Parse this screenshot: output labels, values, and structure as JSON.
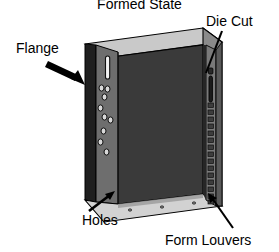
{
  "figure": {
    "title": "Formed State",
    "type": "technical-illustration"
  },
  "callouts": [
    {
      "id": "flange",
      "label": "Flange",
      "pointer": "arrow",
      "target": "left vertical flange strip"
    },
    {
      "id": "diecut",
      "label": "Die Cut",
      "pointer": "leader-line",
      "target": "vertical die cut slot on right return"
    },
    {
      "id": "holes",
      "label": "Holes",
      "pointer": "arrow",
      "target": "bottom flange hole row"
    },
    {
      "id": "louvers",
      "label": "Form Louvers",
      "pointer": "leader-line",
      "target": "louver slot column on right return"
    }
  ],
  "geometry": {
    "flange_slot_count": 1,
    "flange_hole_count": 9,
    "louver_count": 16,
    "bottom_hole_count": 3
  },
  "colors": {
    "background": "#ffffff",
    "face_dark": "#3a3a3a",
    "side_mid": "#6e6e6e",
    "top_light": "#c9c9c9",
    "bottom_light": "#d2d2d2",
    "edge_black": "#1a1a1a",
    "outline": "#000000",
    "slot_fill": "#f2f2f2",
    "text": "#000000"
  }
}
